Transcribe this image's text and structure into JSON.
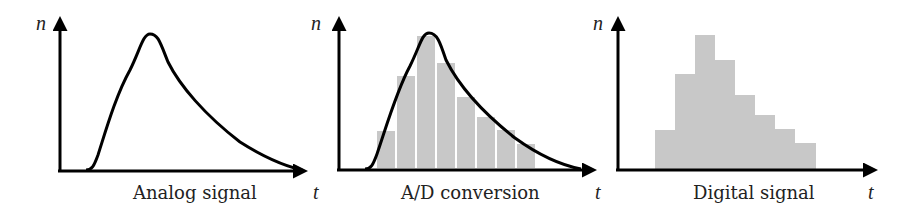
{
  "panels": [
    {
      "id": "analog",
      "caption": "Analog signal",
      "y_label": "n",
      "x_label": "t"
    },
    {
      "id": "ad",
      "caption": "A/D conversion",
      "y_label": "n",
      "x_label": "t"
    },
    {
      "id": "digital",
      "caption": "Digital signal",
      "y_label": "n",
      "x_label": "t"
    }
  ],
  "colors": {
    "axis": "#000000",
    "curve": "#000000",
    "bar": "#c8c8c8"
  },
  "sample_levels": [
    3,
    7,
    10,
    8,
    5.5,
    4,
    3,
    2
  ]
}
